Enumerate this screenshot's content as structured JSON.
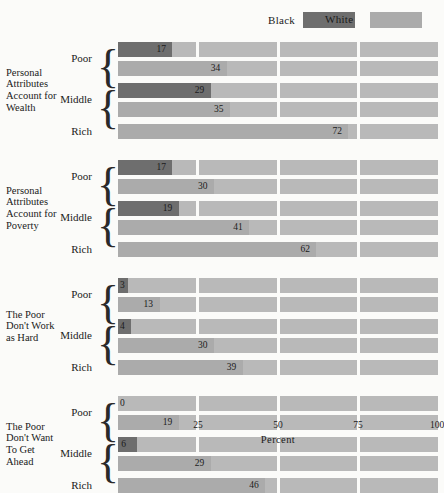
{
  "legend": {
    "items": [
      {
        "label": "Black",
        "color": "#6e6e6e",
        "icon": "legend-swatch-black"
      },
      {
        "label": "White",
        "color": "#ababab",
        "icon": "legend-swatch-white"
      }
    ]
  },
  "axis": {
    "title": "Percent",
    "ticks": [
      "25",
      "50",
      "75",
      "100"
    ],
    "tick_values": [
      25,
      50,
      75,
      100
    ],
    "min": 0,
    "max": 100
  },
  "categories": [
    "Poor",
    "Middle",
    "Rich"
  ],
  "groups": [
    {
      "title": "Personal\nAttributes\nAccount for\nWealth",
      "title_lines": [
        "Personal",
        "Attributes",
        "Account for",
        "Wealth"
      ],
      "rows": [
        {
          "category": "Poor",
          "series": "Black",
          "value": 17,
          "label": "17"
        },
        {
          "category": "Poor",
          "series": "White",
          "value": 34,
          "label": "34"
        },
        {
          "category": "Middle",
          "series": "Black",
          "value": 29,
          "label": "29"
        },
        {
          "category": "Middle",
          "series": "White",
          "value": 35,
          "label": "35"
        },
        {
          "category": "Rich",
          "series": "White",
          "value": 72,
          "label": "72"
        }
      ]
    },
    {
      "title": "Personal\nAttributes\nAccount for\nPoverty",
      "title_lines": [
        "Personal",
        "Attributes",
        "Account for",
        "Poverty"
      ],
      "rows": [
        {
          "category": "Poor",
          "series": "Black",
          "value": 17,
          "label": "17"
        },
        {
          "category": "Poor",
          "series": "White",
          "value": 30,
          "label": "30"
        },
        {
          "category": "Middle",
          "series": "Black",
          "value": 19,
          "label": "19"
        },
        {
          "category": "Middle",
          "series": "White",
          "value": 41,
          "label": "41"
        },
        {
          "category": "Rich",
          "series": "White",
          "value": 62,
          "label": "62"
        }
      ]
    },
    {
      "title": "The Poor\nDon't Work\nas Hard",
      "title_lines": [
        "The Poor",
        "Don't Work",
        "as Hard"
      ],
      "rows": [
        {
          "category": "Poor",
          "series": "Black",
          "value": 3,
          "label": "3"
        },
        {
          "category": "Poor",
          "series": "White",
          "value": 13,
          "label": "13"
        },
        {
          "category": "Middle",
          "series": "Black",
          "value": 4,
          "label": "4"
        },
        {
          "category": "Middle",
          "series": "White",
          "value": 30,
          "label": "30"
        },
        {
          "category": "Rich",
          "series": "White",
          "value": 39,
          "label": "39"
        }
      ]
    },
    {
      "title": "The Poor\nDon't Want\nTo Get\nAhead",
      "title_lines": [
        "The Poor",
        "Don't Want",
        "To Get",
        "Ahead"
      ],
      "rows": [
        {
          "category": "Poor",
          "series": "Black",
          "value": 0,
          "label": "0"
        },
        {
          "category": "Poor",
          "series": "White",
          "value": 19,
          "label": "19"
        },
        {
          "category": "Middle",
          "series": "Black",
          "value": 6,
          "label": "6"
        },
        {
          "category": "Middle",
          "series": "White",
          "value": 29,
          "label": "29"
        },
        {
          "category": "Rich",
          "series": "White",
          "value": 46,
          "label": "46"
        }
      ]
    }
  ],
  "chart_data": {
    "type": "bar",
    "orientation": "horizontal",
    "title": "",
    "xlabel": "Percent",
    "ylabel": "",
    "xlim": [
      0,
      100
    ],
    "xticks": [
      25,
      50,
      75,
      100
    ],
    "grid": false,
    "legend_position": "top-right",
    "legend_entries": [
      "Black",
      "White"
    ],
    "group_labels": [
      "Personal Attributes Account for Wealth",
      "Personal Attributes Account for Poverty",
      "The Poor Don't Work as Hard",
      "The Poor Don't Want To Get Ahead"
    ],
    "categories": [
      "Poor",
      "Middle",
      "Rich"
    ],
    "series": [
      {
        "name": "Black",
        "color": "#6e6e6e",
        "values_by_group": [
          {
            "group": "Personal Attributes Account for Wealth",
            "Poor": 17,
            "Middle": 29,
            "Rich": null
          },
          {
            "group": "Personal Attributes Account for Poverty",
            "Poor": 17,
            "Middle": 19,
            "Rich": null
          },
          {
            "group": "The Poor Don't Work as Hard",
            "Poor": 3,
            "Middle": 4,
            "Rich": null
          },
          {
            "group": "The Poor Don't Want To Get Ahead",
            "Poor": 0,
            "Middle": 6,
            "Rich": null
          }
        ]
      },
      {
        "name": "White",
        "color": "#ababab",
        "values_by_group": [
          {
            "group": "Personal Attributes Account for Wealth",
            "Poor": 34,
            "Middle": 35,
            "Rich": 72
          },
          {
            "group": "Personal Attributes Account for Poverty",
            "Poor": 30,
            "Middle": 41,
            "Rich": 62
          },
          {
            "group": "The Poor Don't Work as Hard",
            "Poor": 13,
            "Middle": 30,
            "Rich": 39
          },
          {
            "group": "The Poor Don't Want To Get Ahead",
            "Poor": 19,
            "Middle": 29,
            "Rich": 46
          }
        ]
      }
    ]
  }
}
